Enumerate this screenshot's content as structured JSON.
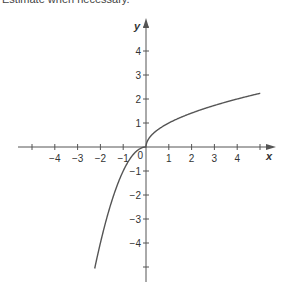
{
  "caption": "Estimate when necessary.",
  "chart_data": {
    "type": "line",
    "title": "",
    "xlabel": "x",
    "ylabel": "y",
    "xlim": [
      -5.5,
      5.5
    ],
    "ylim": [
      -5.8,
      5.8
    ],
    "xticks": [
      -4,
      -3,
      -2,
      -1,
      1,
      2,
      3,
      4
    ],
    "yticks": [
      -4,
      -3,
      -2,
      -1,
      1,
      2,
      3,
      4
    ],
    "x_tick_marks": [
      -5,
      -4,
      -3,
      -2,
      -1,
      1,
      2,
      3,
      4,
      5
    ],
    "y_tick_marks": [
      -5,
      -4,
      -3,
      -2,
      -1,
      1,
      2,
      3,
      4,
      5
    ],
    "origin_label": "0",
    "grid": false,
    "legend": null,
    "series": [
      {
        "name": "f(x)",
        "color": "#555555",
        "x": [
          -2.25,
          -2,
          -1.5,
          -1,
          -0.5,
          -0.25,
          0,
          0.25,
          0.5,
          1,
          2,
          3,
          4,
          5
        ],
        "y": [
          -5.06,
          -4,
          -2.25,
          -1,
          -0.25,
          -0.06,
          0,
          0.5,
          0.71,
          1,
          1.41,
          1.73,
          2,
          2.24
        ]
      }
    ]
  },
  "colors": {
    "axis": "#555555",
    "curve": "#555555",
    "text": "#333333"
  }
}
